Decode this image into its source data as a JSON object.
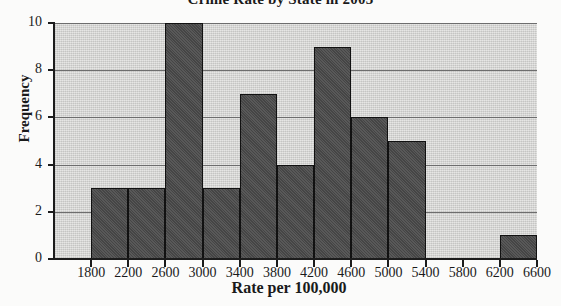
{
  "title": "Crime Rate by State in 2003",
  "colors": {
    "bar_fill": "#4c4c4c",
    "bar_outline": "#111111",
    "plot_background": "#d8d8d6",
    "gridline": "#6d6d6d",
    "axis": "#1c1c1c",
    "page_background": "#fbfbfa"
  },
  "chart_data": {
    "type": "bar",
    "title": "Crime Rate by State in 2003",
    "xlabel": "Rate per 100,000",
    "ylabel": "Frequency",
    "grid": true,
    "legend": null,
    "xlim": [
      1400,
      6600
    ],
    "ylim": [
      0,
      10
    ],
    "ytick_labels": [
      "0",
      "2",
      "4",
      "6",
      "8",
      "10"
    ],
    "ytick_values": [
      0,
      2,
      4,
      6,
      8,
      10
    ],
    "xtick_labels": [
      "1800",
      "2200",
      "2600",
      "3000",
      "3400",
      "3800",
      "4200",
      "4600",
      "5000",
      "5400",
      "5800",
      "6200",
      "6600"
    ],
    "xtick_values": [
      1800,
      2200,
      2600,
      3000,
      3400,
      3800,
      4200,
      4600,
      5000,
      5400,
      5800,
      6200,
      6600
    ],
    "bin_width": 400,
    "bins": [
      {
        "start": 1400,
        "end": 1800,
        "frequency": 0
      },
      {
        "start": 1800,
        "end": 2200,
        "frequency": 3
      },
      {
        "start": 2200,
        "end": 2600,
        "frequency": 3
      },
      {
        "start": 2600,
        "end": 3000,
        "frequency": 10
      },
      {
        "start": 3000,
        "end": 3400,
        "frequency": 3
      },
      {
        "start": 3400,
        "end": 3800,
        "frequency": 7
      },
      {
        "start": 3800,
        "end": 4200,
        "frequency": 4
      },
      {
        "start": 4200,
        "end": 4600,
        "frequency": 9
      },
      {
        "start": 4600,
        "end": 5000,
        "frequency": 6
      },
      {
        "start": 5000,
        "end": 5400,
        "frequency": 5
      },
      {
        "start": 5400,
        "end": 5800,
        "frequency": 0
      },
      {
        "start": 5800,
        "end": 6200,
        "frequency": 0
      },
      {
        "start": 6200,
        "end": 6600,
        "frequency": 1
      }
    ],
    "categories": [
      "1400-1800",
      "1800-2200",
      "2200-2600",
      "2600-3000",
      "3000-3400",
      "3400-3800",
      "3800-4200",
      "4200-4600",
      "4600-5000",
      "5000-5400",
      "5400-5800",
      "5800-6200",
      "6200-6600"
    ],
    "values": [
      0,
      3,
      3,
      10,
      3,
      7,
      4,
      9,
      6,
      5,
      0,
      0,
      1
    ]
  }
}
